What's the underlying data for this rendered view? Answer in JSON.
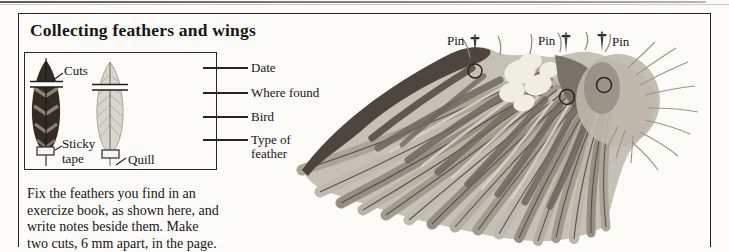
{
  "page": {
    "title": "Collecting feathers and wings"
  },
  "feather_box": {
    "labels": {
      "cuts": "Cuts",
      "sticky_tape": "Sticky tape",
      "quill": "Quill"
    }
  },
  "record_fields": [
    "Date",
    "Where found",
    "Bird",
    "Type of feather"
  ],
  "caption": {
    "lines": [
      "Fix the feathers you find in an",
      "exercize book, as shown here, and",
      "write notes beside them. Make",
      "two cuts, 6 mm apart, in the page."
    ]
  },
  "wing": {
    "pin_labels": [
      "Pin",
      "Pin",
      "Pin"
    ]
  },
  "colors": {
    "paper": "#fcfbf8",
    "frame": "#262626",
    "text": "#161616",
    "dark_feather": "#332c25",
    "pale_feather": "#d8d5cc",
    "wing_base": "#c6c1b6",
    "wing_dark_band": "#4d463e",
    "wing_highlight": "#f0ede5"
  }
}
